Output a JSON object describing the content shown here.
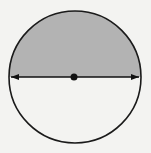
{
  "figure": {
    "title": "Circle with diameter and shaded semicircle",
    "background_color": "#f3f3f1",
    "circle": {
      "cx": 75,
      "cy": 77,
      "r": 66,
      "stroke": "#1a1a1a",
      "stroke_width": 1.6
    },
    "shaded_region": {
      "part": "upper semicircle",
      "fill": "#b3b3b3"
    },
    "diameter": {
      "y": 77,
      "x1": 9,
      "x2": 141,
      "arrowheads": "both ends",
      "color": "#111111"
    },
    "center_point": {
      "x": 74,
      "y": 77,
      "r": 3.5,
      "color": "#111111"
    }
  }
}
